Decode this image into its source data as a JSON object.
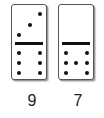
{
  "dominoes": [
    {
      "top_pips": 3,
      "bottom_pips": 6,
      "label": "9"
    },
    {
      "top_pips": 0,
      "bottom_pips": 7,
      "label": "7"
    }
  ]
}
